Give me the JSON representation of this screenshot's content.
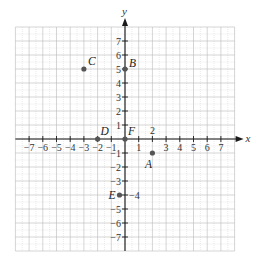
{
  "figure": {
    "type": "coordinate-plane",
    "x_axis_label": "x",
    "y_axis_label": "y",
    "x_range": [
      -8,
      8
    ],
    "y_range": [
      -8,
      8
    ],
    "x_tick_labels": [
      "−7",
      "−6",
      "−5",
      "−4",
      "−3",
      "−2",
      "−1",
      "1",
      "3",
      "4",
      "5",
      "6",
      "7"
    ],
    "x_tick_values": [
      -7,
      -6,
      -5,
      -4,
      -3,
      -2,
      -1,
      1,
      3,
      4,
      5,
      6,
      7
    ],
    "y_tick_labels": [
      "7",
      "6",
      "5",
      "4",
      "3",
      "2",
      "1",
      "−1",
      "−2",
      "−3",
      "−5",
      "−6",
      "−7"
    ],
    "y_tick_values": [
      7,
      6,
      5,
      4,
      3,
      2,
      1,
      -1,
      -2,
      -3,
      -5,
      -6,
      -7
    ],
    "points": [
      {
        "label": "A",
        "x": 2,
        "y": -1
      },
      {
        "label": "B",
        "x": 0,
        "y": 5
      },
      {
        "label": "C",
        "x": -3,
        "y": 5
      },
      {
        "label": "D",
        "x": -2,
        "y": 0
      },
      {
        "label": "E",
        "x": -0.4,
        "y": -4
      },
      {
        "label": "F",
        "x": 0,
        "y": 0
      }
    ],
    "annotations": [
      {
        "text": "2",
        "near": "A",
        "meaning": "x-coordinate of A"
      },
      {
        "text": "−4",
        "near": "E",
        "meaning": "y-coordinate of E"
      }
    ],
    "colors": {
      "grid": "#b9b9b9",
      "axis": "#1a1a1a",
      "point": "#555555"
    }
  }
}
